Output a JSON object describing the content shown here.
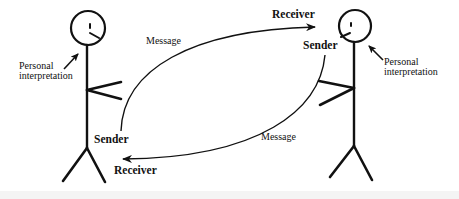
{
  "diagram": {
    "colors": {
      "stroke": "#111111",
      "background": "#ffffff",
      "bottom_strip": "#f4f4f4"
    },
    "left_person": {
      "interpretation_label_line1": "Personal",
      "interpretation_label_line2": "interpretation",
      "sender_label": "Sender",
      "receiver_label": "Receiver"
    },
    "right_person": {
      "interpretation_label_line1": "Personal",
      "interpretation_label_line2": "interpretation",
      "sender_label": "Sender",
      "receiver_label": "Receiver"
    },
    "messages": [
      {
        "label": "Message",
        "from": "left_person",
        "to": "right_person"
      },
      {
        "label": "Message",
        "from": "right_person",
        "to": "left_person"
      }
    ]
  }
}
